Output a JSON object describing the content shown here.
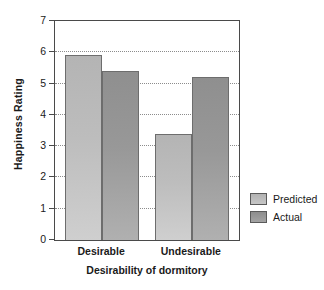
{
  "chart_data": {
    "type": "bar",
    "title": "",
    "xlabel": "Desirability of dormitory",
    "ylabel": "Happiness Rating",
    "categories": [
      "Desirable",
      "Undesirable"
    ],
    "series": [
      {
        "name": "Predicted",
        "values": [
          5.9,
          3.4
        ],
        "color": "#bdbdbd"
      },
      {
        "name": "Actual",
        "values": [
          5.4,
          5.2
        ],
        "color": "#989898"
      }
    ],
    "ylim": [
      0,
      7
    ],
    "yticks": [
      0,
      1,
      2,
      3,
      4,
      5,
      6,
      7
    ],
    "ytick_labels": [
      "0",
      "1",
      "2",
      "3",
      "4",
      "5",
      "6",
      "7"
    ],
    "gridlines": [
      1,
      2,
      3,
      4,
      5,
      6
    ],
    "grid": true,
    "grid_style": "dotted",
    "legend_position": "right",
    "frame": true
  },
  "legend": {
    "items": [
      {
        "label": "Predicted"
      },
      {
        "label": "Actual"
      }
    ]
  }
}
